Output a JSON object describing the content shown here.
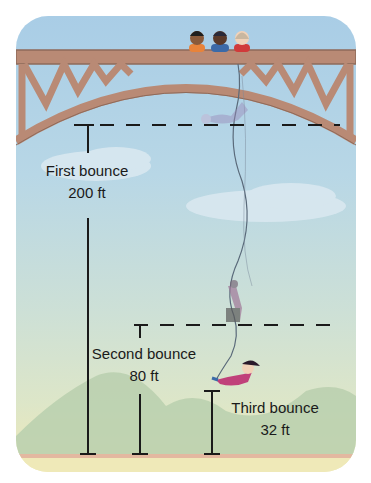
{
  "diagram": {
    "colors": {
      "sky_top": "#a9cde6",
      "sky_bottom": "#dde6c8",
      "bridge": "#b98a75",
      "bridge_dark": "#8e6a5a",
      "hills": "#b9cfae",
      "ground": "#efe9b8",
      "ground_line": "#e3b8a0",
      "line": "#1a1a1a"
    },
    "bounces": [
      {
        "name": "First bounce",
        "height": "200 ft",
        "value_ft": 200
      },
      {
        "name": "Second bounce",
        "height": "80 ft",
        "value_ft": 80
      },
      {
        "name": "Third bounce",
        "height": "32 ft",
        "value_ft": 32
      }
    ],
    "people_on_bridge": 3
  }
}
